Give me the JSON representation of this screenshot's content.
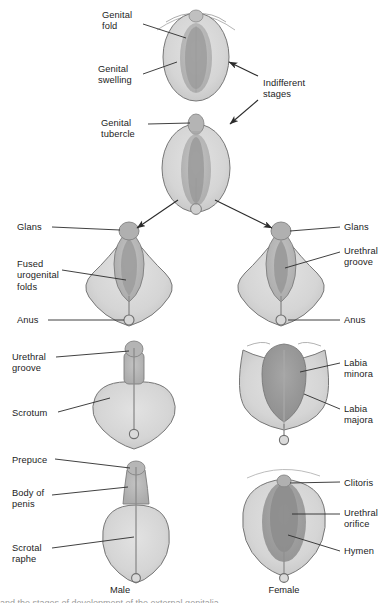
{
  "figure": {
    "title": "Development of the external genitalia",
    "bottom_partial_caption": "and the stages of development of the external genitalia",
    "captions": [
      {
        "id": "male",
        "text": "Male",
        "x": 120,
        "y": 585
      },
      {
        "id": "female",
        "text": "Female",
        "x": 268,
        "y": 585
      }
    ],
    "group_label": {
      "id": "indifferent-stages",
      "text": "Indifferent\nstages",
      "x": 263,
      "y": 78
    },
    "labels": [
      {
        "id": "genital-fold",
        "text": "Genital\nfold",
        "x": 102,
        "y": 10,
        "side": "left"
      },
      {
        "id": "genital-swelling",
        "text": "Genital\nswelling",
        "x": 98,
        "y": 64,
        "side": "left"
      },
      {
        "id": "genital-tubercle",
        "text": "Genital\ntubercle",
        "x": 101,
        "y": 118,
        "side": "left"
      },
      {
        "id": "glans-male",
        "text": "Glans",
        "x": 17,
        "y": 222,
        "side": "left"
      },
      {
        "id": "fused-urogenital",
        "text": "Fused\nurogenital\nfolds",
        "x": 17,
        "y": 259,
        "side": "left"
      },
      {
        "id": "anus-male",
        "text": "Anus",
        "x": 17,
        "y": 315,
        "side": "left"
      },
      {
        "id": "urethral-groove-m",
        "text": "Urethral\ngroove",
        "x": 12,
        "y": 352,
        "side": "left"
      },
      {
        "id": "scrotum",
        "text": "Scrotum",
        "x": 12,
        "y": 408,
        "side": "left"
      },
      {
        "id": "prepuce",
        "text": "Prepuce",
        "x": 12,
        "y": 455,
        "side": "left"
      },
      {
        "id": "body-of-penis",
        "text": "Body of\npenis",
        "x": 12,
        "y": 488,
        "side": "left"
      },
      {
        "id": "scrotal-raphe",
        "text": "Scrotal\nraphe",
        "x": 12,
        "y": 543,
        "side": "left"
      },
      {
        "id": "glans-female",
        "text": "Glans",
        "x": 344,
        "y": 222,
        "side": "right"
      },
      {
        "id": "urethral-groove-f",
        "text": "Urethral\ngroove",
        "x": 344,
        "y": 246,
        "side": "right"
      },
      {
        "id": "anus-female",
        "text": "Anus",
        "x": 344,
        "y": 315,
        "side": "right"
      },
      {
        "id": "labia-minora",
        "text": "Labia\nminora",
        "x": 344,
        "y": 358,
        "side": "right"
      },
      {
        "id": "labia-majora",
        "text": "Labia\nmajora",
        "x": 344,
        "y": 404,
        "side": "right"
      },
      {
        "id": "clitoris",
        "text": "Clitoris",
        "x": 344,
        "y": 478,
        "side": "right"
      },
      {
        "id": "urethral-orifice",
        "text": "Urethral\norifice",
        "x": 344,
        "y": 508,
        "side": "right"
      },
      {
        "id": "hymen",
        "text": "Hymen",
        "x": 344,
        "y": 546,
        "side": "right"
      }
    ],
    "stages": [
      {
        "id": "indifferent-stage-1",
        "name": "Indifferent stage - early",
        "cx": 196,
        "cy": 55
      },
      {
        "id": "indifferent-stage-2",
        "name": "Indifferent stage - tubercle",
        "cx": 196,
        "cy": 162
      },
      {
        "id": "male-stage-1",
        "name": "Male - fused urogenital folds",
        "cx": 129,
        "cy": 272
      },
      {
        "id": "female-stage-1",
        "name": "Female - urethral groove",
        "cx": 281,
        "cy": 272
      },
      {
        "id": "male-stage-2",
        "name": "Male - scrotum",
        "cx": 134,
        "cy": 395
      },
      {
        "id": "female-stage-2",
        "name": "Female - labia",
        "cx": 284,
        "cy": 395
      },
      {
        "id": "male-stage-3",
        "name": "Male - penis",
        "cx": 136,
        "cy": 520
      },
      {
        "id": "female-stage-3",
        "name": "Female - vulva",
        "cx": 284,
        "cy": 520
      }
    ],
    "colors": {
      "tissue_light": "#d7d7d7",
      "tissue_mid": "#b9b9b9",
      "tissue_dark": "#9d9d9d",
      "tissue_darkest": "#8a8a8a",
      "outline": "#6e6e6e",
      "leader": "#2b2b2b",
      "background": "#ffffff",
      "text": "#1c1c1c"
    }
  }
}
